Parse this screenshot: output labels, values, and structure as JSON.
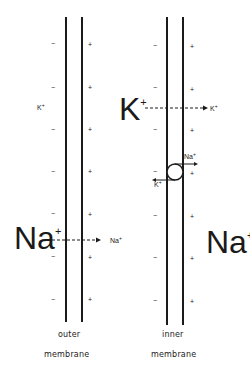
{
  "diagram": {
    "outer_membrane": {
      "label_line1": "outer",
      "label_line2": "membrane",
      "inside_signs": [
        "−",
        "−",
        "−",
        "−",
        "−",
        "−",
        "−"
      ],
      "outside_signs": [
        "+",
        "+",
        "+",
        "+",
        "+",
        "+",
        "+"
      ]
    },
    "inner_membrane": {
      "label_line1": "inner",
      "label_line2": "membrane",
      "inside_signs": [
        "−",
        "−",
        "−",
        "−",
        "−",
        "−",
        "−"
      ],
      "outside_signs": [
        "+",
        "+",
        "+",
        "+",
        "+",
        "+",
        "+"
      ]
    },
    "ions": {
      "k_small_left": {
        "symbol": "K",
        "charge": "+"
      },
      "k_large_mid": {
        "symbol": "K",
        "charge": "+"
      },
      "k_arrow_target": {
        "symbol": "K",
        "charge": "+"
      },
      "na_large_left": {
        "symbol": "Na",
        "charge": "+"
      },
      "na_arrow_target": {
        "symbol": "Na",
        "charge": "+"
      },
      "na_large_right": {
        "symbol": "Na",
        "charge": "+"
      },
      "pump_na": {
        "symbol": "Na",
        "charge": "+"
      },
      "pump_k": {
        "symbol": "K",
        "charge": "+"
      }
    },
    "colors": {
      "line": "#1a1a1a",
      "background": "#ffffff"
    }
  }
}
